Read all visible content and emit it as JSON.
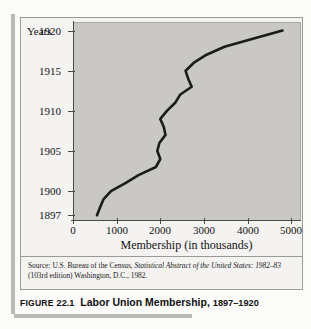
{
  "caption": {
    "figure_word": "FIGURE",
    "figure_number": "22.1",
    "title": "Labor Union Membership,",
    "years": "1897–1920"
  },
  "source_note": {
    "prefix": "Source: U.S. Bureau of the Census,",
    "italic_title": "Statistical Abstract of the United States:",
    "italic_title_2": "1982–83",
    "suffix": "(103rd edition) Washington, D.C., 1982."
  },
  "chart_data": {
    "type": "line",
    "title": "Labor Union Membership, 1897–1920",
    "xlabel": "Membership (in thousands)",
    "ylabel": "Years",
    "xlim": [
      0,
      5200
    ],
    "ylim": [
      1896.4,
      1921.2
    ],
    "xticks": [
      "0",
      "1000",
      "2000",
      "3000",
      "4000",
      "5000"
    ],
    "xtick_values": [
      0,
      1000,
      2000,
      3000,
      4000,
      5000
    ],
    "yticks": [
      "1897",
      "1900",
      "1905",
      "1910",
      "1915",
      "1920"
    ],
    "ytick_values": [
      1897,
      1900,
      1905,
      1910,
      1915,
      1920
    ],
    "grid": false,
    "legend": null,
    "orientation": "membership-on-x, year-on-y",
    "series": [
      {
        "name": "Labor union membership",
        "years": [
          1897,
          1898,
          1899,
          1900,
          1901,
          1902,
          1903,
          1904,
          1905,
          1906,
          1907,
          1908,
          1909,
          1910,
          1911,
          1912,
          1913,
          1914,
          1915,
          1916,
          1917,
          1918,
          1919,
          1920
        ],
        "values": [
          550,
          620,
          700,
          870,
          1200,
          1500,
          1900,
          2000,
          1930,
          1980,
          2120,
          2080,
          2000,
          2150,
          2340,
          2450,
          2720,
          2640,
          2580,
          2770,
          3060,
          3470,
          4120,
          4800
        ]
      }
    ]
  }
}
